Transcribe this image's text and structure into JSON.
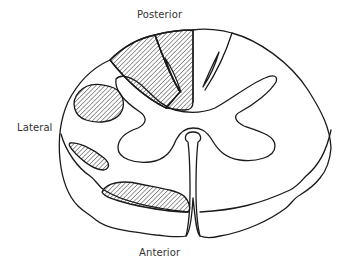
{
  "diagram": {
    "labels": {
      "posterior": "Posterior",
      "lateral": "Lateral",
      "anterior": "Anterior"
    },
    "colors": {
      "stroke": "#1a1a1a",
      "hatch": "#333333",
      "background": "#ffffff",
      "label_text": "#333333"
    },
    "shaded_regions": [
      "posterior-column-lateral",
      "posterior-column-medial",
      "lateral-column-posterior",
      "lateral-column-anterior",
      "anterior-column"
    ]
  }
}
